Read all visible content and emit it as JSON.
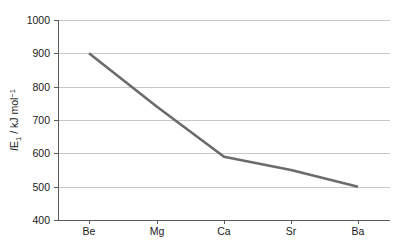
{
  "chart_data": {
    "type": "line",
    "title": "",
    "subtitle": "",
    "xlabel": "",
    "ylabel": "IE1 / kJ mol-1",
    "ylabel_parts": {
      "italic_prefix": "I",
      "roman": "E",
      "subscript": "1",
      "separator": " / kJ mol",
      "superscript": "−1"
    },
    "categories": [
      "Be",
      "Mg",
      "Ca",
      "Sr",
      "Ba"
    ],
    "values": [
      900,
      740,
      590,
      550,
      500
    ],
    "series": [
      {
        "name": "First ionisation energy",
        "values": [
          900,
          740,
          590,
          550,
          500
        ]
      }
    ],
    "ylim": [
      400,
      1000
    ],
    "yticks": [
      400,
      500,
      600,
      700,
      800,
      900,
      1000
    ],
    "ytick_labels": [
      "400",
      "500",
      "600",
      "700",
      "800",
      "900",
      "1000"
    ],
    "xtick_labels": [
      "Be",
      "Mg",
      "Ca",
      "Sr",
      "Ba"
    ],
    "grid": {
      "horizontal": true,
      "vertical": false
    },
    "legend": {
      "visible": false,
      "position": "none"
    },
    "annotations": [],
    "colors": {
      "line": "#6b6b6b",
      "gridline": "#c8c8c8",
      "axis": "#5a5a5a",
      "text": "#1a1a1a",
      "background": "#ffffff"
    }
  },
  "layout": {
    "plot_left": 58,
    "plot_right": 390,
    "plot_top": 20,
    "plot_bottom": 220,
    "xtick_positions": [
      89,
      157,
      224,
      291,
      358
    ],
    "ytick_positions": [
      220,
      186.67,
      153.33,
      120,
      86.67,
      53.33,
      20
    ],
    "xlabel_y": 235,
    "ylabel_x": 18,
    "ylabel_y": 120
  }
}
